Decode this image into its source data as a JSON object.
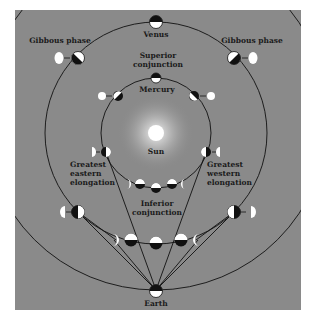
{
  "figure": {
    "background_color": "#8a8a8a",
    "labels": {
      "venus": "Venus",
      "gibbous_left": "Gibbous phase",
      "gibbous_right": "Gibbous phase",
      "superior_conjunction_1": "Superior",
      "superior_conjunction_2": "conjunction",
      "mercury": "Mercury",
      "sun": "Sun",
      "greatest_eastern_1": "Greatest",
      "greatest_eastern_2": "eastern",
      "greatest_eastern_3": "elongation",
      "greatest_western_1": "Greatest",
      "greatest_western_2": "western",
      "greatest_western_3": "elongation",
      "inferior_conjunction_1": "Inferior",
      "inferior_conjunction_2": "conjunction",
      "earth": "Earth"
    },
    "bodies": [
      "Sun",
      "Mercury",
      "Venus",
      "Earth"
    ],
    "orbits": [
      "Mercury orbit",
      "Venus orbit",
      "Earth orbit"
    ]
  }
}
